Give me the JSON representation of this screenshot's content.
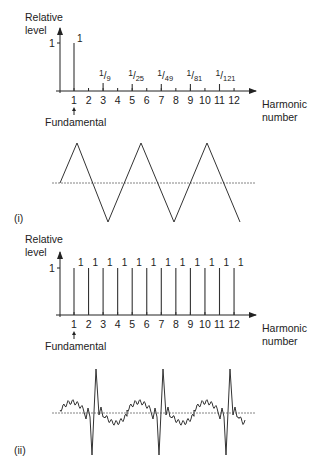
{
  "panel_i": {
    "ylabel_line1": "Relative",
    "ylabel_line2": "level",
    "ytick": "1",
    "xlabel_line1": "Harmonic",
    "xlabel_line2": "number",
    "fundamental_label": "Fundamental",
    "panel_label": "(i)",
    "waveform": "triangle-wave",
    "bar_labels": [
      {
        "harmonic": 1,
        "num": "1",
        "den": ""
      },
      {
        "harmonic": 3,
        "num": "1",
        "den": "9"
      },
      {
        "harmonic": 5,
        "num": "1",
        "den": "25"
      },
      {
        "harmonic": 7,
        "num": "1",
        "den": "49"
      },
      {
        "harmonic": 9,
        "num": "1",
        "den": "81"
      },
      {
        "harmonic": 11,
        "num": "1",
        "den": "121"
      }
    ]
  },
  "panel_ii": {
    "ylabel_line1": "Relative",
    "ylabel_line2": "level",
    "ytick": "1",
    "xlabel_line1": "Harmonic",
    "xlabel_line2": "number",
    "fundamental_label": "Fundamental",
    "panel_label": "(ii)",
    "waveform": "pulse-train",
    "bar_label": "1"
  },
  "x_ticks": [
    "1",
    "2",
    "3",
    "4",
    "5",
    "6",
    "7",
    "8",
    "9",
    "10",
    "11",
    "12"
  ],
  "chart_data": [
    {
      "type": "bar",
      "title": "(i) Triangle wave spectrum",
      "xlabel": "Harmonic number",
      "ylabel": "Relative level",
      "categories": [
        1,
        2,
        3,
        4,
        5,
        6,
        7,
        8,
        9,
        10,
        11,
        12
      ],
      "values": [
        1,
        0,
        0.111,
        0,
        0.04,
        0,
        0.0204,
        0,
        0.0123,
        0,
        0.00826,
        0
      ],
      "value_labels": [
        "1",
        "",
        "1/9",
        "",
        "1/25",
        "",
        "1/49",
        "",
        "1/81",
        "",
        "1/121",
        ""
      ],
      "ylim": [
        0,
        1
      ]
    },
    {
      "type": "bar",
      "title": "(ii) Pulse train spectrum",
      "xlabel": "Harmonic number",
      "ylabel": "Relative level",
      "categories": [
        1,
        2,
        3,
        4,
        5,
        6,
        7,
        8,
        9,
        10,
        11,
        12
      ],
      "values": [
        1,
        1,
        1,
        1,
        1,
        1,
        1,
        1,
        1,
        1,
        1,
        1
      ],
      "value_labels": [
        "1",
        "1",
        "1",
        "1",
        "1",
        "1",
        "1",
        "1",
        "1",
        "1",
        "1",
        "1"
      ],
      "ylim": [
        0,
        1
      ]
    }
  ]
}
